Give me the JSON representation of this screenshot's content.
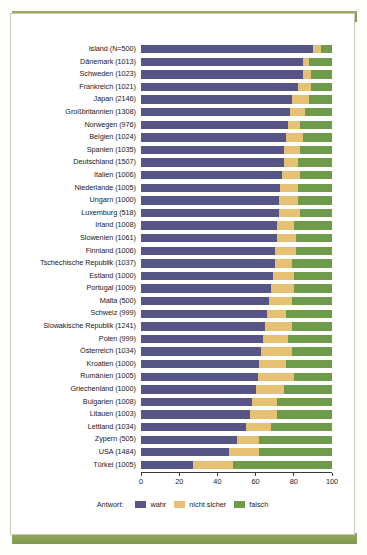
{
  "figure": {
    "background_color": "#ffffff",
    "band_color": "#8ba257",
    "frame_border_color": "#c9c9c2"
  },
  "chart_data": {
    "type": "bar",
    "orientation": "horizontal",
    "stacked": true,
    "stack_mode": "percent",
    "title": "",
    "subtitle": "",
    "xlabel": "",
    "ylabel": "",
    "xlim": [
      0,
      100
    ],
    "xticks": [
      0,
      20,
      40,
      60,
      80,
      100
    ],
    "xticklabels": [
      "0",
      "20",
      "40",
      "60",
      "80",
      "100"
    ],
    "grid": false,
    "legend_title": "Antwort:",
    "legend_position": "bottom-center",
    "legend": [
      "wahr",
      "nicht sicher",
      "falsch"
    ],
    "colors": {
      "wahr": "#575586",
      "nicht sicher": "#e6c173",
      "falsch": "#6f9c4b"
    },
    "categories": [
      "Island (N=500)",
      "Dänemark (1013)",
      "Schweden (1023)",
      "Frankreich (1021)",
      "Japan (2146)",
      "Großbritannien (1308)",
      "Norwegen (976)",
      "Belgien (1024)",
      "Spanien (1035)",
      "Deutschland (1507)",
      "Italien (1006)",
      "Niederlande (1005)",
      "Ungarn (1000)",
      "Luxemburg (518)",
      "Irland (1008)",
      "Slowenien (1061)",
      "Finnland (1006)",
      "Tschechische Republik (1037)",
      "Estland (1000)",
      "Portugal (1009)",
      "Malta (500)",
      "Schweiz (999)",
      "Slowakische Republik (1241)",
      "Polen (999)",
      "Österreich (1034)",
      "Kroatien (1000)",
      "Rumänien (1005)",
      "Griechenland (1000)",
      "Bulgarien (1008)",
      "Litauen (1003)",
      "Lettland (1034)",
      "Zypern (505)",
      "USA (1484)",
      "Türkei (1005)"
    ],
    "series": [
      {
        "name": "wahr",
        "values": [
          90,
          85,
          85,
          82,
          79,
          78,
          77,
          76,
          75,
          75,
          74,
          73,
          72,
          72,
          71,
          71,
          70,
          70,
          69,
          68,
          67,
          66,
          65,
          64,
          63,
          62,
          61,
          60,
          58,
          57,
          55,
          50,
          46,
          27
        ]
      },
      {
        "name": "nicht sicher",
        "values": [
          4,
          3,
          4,
          7,
          9,
          8,
          6,
          9,
          8,
          7,
          9,
          9,
          10,
          11,
          9,
          10,
          11,
          9,
          11,
          12,
          12,
          10,
          14,
          13,
          16,
          14,
          19,
          15,
          13,
          14,
          13,
          12,
          16,
          21
        ]
      },
      {
        "name": "falsch",
        "values": [
          6,
          12,
          11,
          11,
          12,
          14,
          17,
          15,
          17,
          18,
          17,
          18,
          18,
          17,
          20,
          19,
          19,
          21,
          20,
          20,
          21,
          24,
          21,
          23,
          21,
          24,
          20,
          25,
          29,
          29,
          32,
          38,
          38,
          52
        ]
      }
    ]
  }
}
